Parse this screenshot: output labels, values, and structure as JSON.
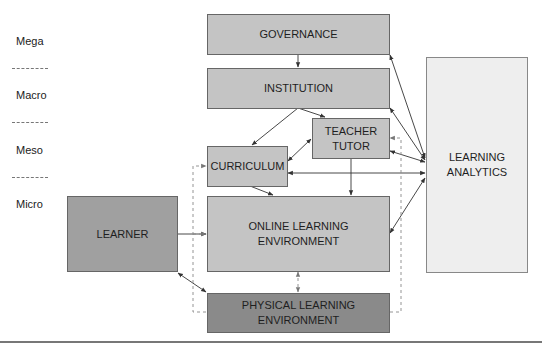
{
  "levels": [
    "Mega",
    "Macro",
    "Meso",
    "Micro"
  ],
  "nodes": {
    "governance": "GOVERNANCE",
    "institution": "INSTITUTION",
    "teacher_tutor_1": "TEACHER",
    "teacher_tutor_2": "TUTOR",
    "curriculum": "CURRICULUM",
    "online_1": "ONLINE LEARNING",
    "online_2": "ENVIRONMENT",
    "learner": "LEARNER",
    "physical_1": "PHYSICAL LEARNING",
    "physical_2": "ENVIRONMENT",
    "analytics_1": "LEARNING",
    "analytics_2": "ANALYTICS"
  },
  "edges": [
    {
      "from": "GOVERNANCE",
      "to": "INSTITUTION",
      "style": "solid"
    },
    {
      "from": "INSTITUTION",
      "to": "CURRICULUM",
      "style": "solid"
    },
    {
      "from": "INSTITUTION",
      "to": "TEACHER TUTOR",
      "style": "solid"
    },
    {
      "from": "TEACHER TUTOR",
      "to": "CURRICULUM",
      "style": "solid",
      "bidirectional": true
    },
    {
      "from": "TEACHER TUTOR",
      "to": "ONLINE LEARNING ENVIRONMENT",
      "style": "solid"
    },
    {
      "from": "CURRICULUM",
      "to": "ONLINE LEARNING ENVIRONMENT",
      "style": "solid"
    },
    {
      "from": "LEARNER",
      "to": "ONLINE LEARNING ENVIRONMENT",
      "style": "solid"
    },
    {
      "from": "LEARNER",
      "to": "PHYSICAL LEARNING ENVIRONMENT",
      "style": "solid",
      "bidirectional": true
    },
    {
      "from": "ONLINE LEARNING ENVIRONMENT",
      "to": "PHYSICAL LEARNING ENVIRONMENT",
      "style": "dashed",
      "bidirectional": true
    },
    {
      "from": "LEARNING ANALYTICS",
      "to": "GOVERNANCE",
      "style": "solid",
      "bidirectional": true
    },
    {
      "from": "LEARNING ANALYTICS",
      "to": "INSTITUTION",
      "style": "solid",
      "bidirectional": true
    },
    {
      "from": "LEARNING ANALYTICS",
      "to": "TEACHER TUTOR",
      "style": "solid",
      "bidirectional": true
    },
    {
      "from": "LEARNING ANALYTICS",
      "to": "CURRICULUM",
      "style": "solid",
      "bidirectional": true
    },
    {
      "from": "LEARNING ANALYTICS",
      "to": "ONLINE LEARNING ENVIRONMENT",
      "style": "solid",
      "bidirectional": true
    },
    {
      "from": "PHYSICAL LEARNING ENVIRONMENT",
      "to": "CURRICULUM",
      "style": "dashed"
    },
    {
      "from": "PHYSICAL LEARNING ENVIRONMENT",
      "to": "ONLINE LEARNING ENVIRONMENT",
      "style": "dashed"
    },
    {
      "from": "PHYSICAL LEARNING ENVIRONMENT",
      "to": "TEACHER TUTOR",
      "style": "dashed"
    }
  ],
  "colors": {
    "light_box": "#c4c4c4",
    "mid_box": "#a0a0a0",
    "dark_box": "#8a8a8a",
    "pale_box": "#eeeeee"
  }
}
